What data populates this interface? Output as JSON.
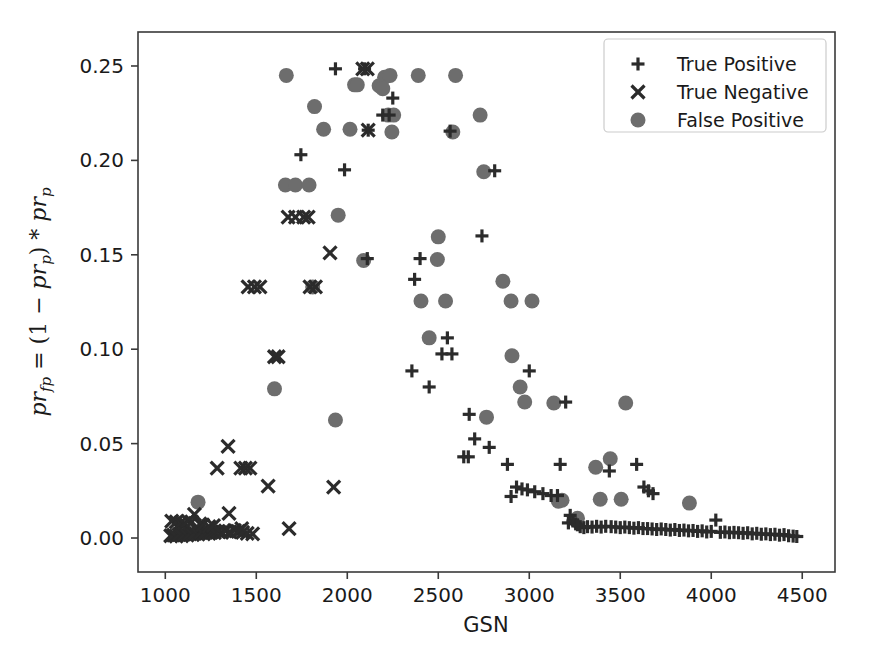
{
  "chart_data": {
    "type": "scatter",
    "title": "",
    "xlabel": "GSN",
    "ylabel": "pr_fp = (1 - pr_p) * pr_p",
    "ylabel_parts": {
      "sym1": "pr",
      "sub1": "fp",
      "eq": " = (1 ",
      "minus": "−",
      "sym2": " pr",
      "sub2": "p",
      "close": ") * ",
      "sym3": "pr",
      "sub3": "p"
    },
    "xlim": [
      850,
      4680
    ],
    "ylim": [
      -0.018,
      0.268
    ],
    "xticks": [
      1000,
      1500,
      2000,
      2500,
      3000,
      3500,
      4000,
      4500
    ],
    "xtick_labels": [
      "1000",
      "1500",
      "2000",
      "2500",
      "3000",
      "3500",
      "4000",
      "4500"
    ],
    "yticks": [
      0.0,
      0.05,
      0.1,
      0.15,
      0.2,
      0.25
    ],
    "ytick_labels": [
      "0.00",
      "0.05",
      "0.10",
      "0.15",
      "0.20",
      "0.25"
    ],
    "grid": false,
    "legend_position": "upper right",
    "colors": {
      "true_positive": "#2b2b2b",
      "true_negative": "#2b2b2b",
      "false_positive": "#6d6d6d",
      "axis": "#3a3a3a",
      "text": "#1a1a1a",
      "background": "#ffffff"
    },
    "series": [
      {
        "name": "True Positive",
        "marker": "plus",
        "color": "#2b2b2b",
        "points": [
          [
            1935,
            0.2485
          ],
          [
            2095,
            0.2485
          ],
          [
            2250,
            0.233
          ],
          [
            2195,
            0.224
          ],
          [
            2230,
            0.224
          ],
          [
            2565,
            0.2155
          ],
          [
            2115,
            0.216
          ],
          [
            2810,
            0.1945
          ],
          [
            1745,
            0.203
          ],
          [
            1985,
            0.195
          ],
          [
            2740,
            0.16
          ],
          [
            2110,
            0.148
          ],
          [
            2400,
            0.148
          ],
          [
            2370,
            0.137
          ],
          [
            2550,
            0.106
          ],
          [
            2520,
            0.0975
          ],
          [
            2575,
            0.0975
          ],
          [
            2355,
            0.0885
          ],
          [
            2450,
            0.08
          ],
          [
            3000,
            0.0885
          ],
          [
            2670,
            0.0655
          ],
          [
            2700,
            0.0525
          ],
          [
            2780,
            0.048
          ],
          [
            2640,
            0.043
          ],
          [
            2665,
            0.043
          ],
          [
            2880,
            0.039
          ],
          [
            3170,
            0.039
          ],
          [
            3440,
            0.0355
          ],
          [
            3590,
            0.039
          ],
          [
            2930,
            0.027
          ],
          [
            2960,
            0.026
          ],
          [
            2990,
            0.0255
          ],
          [
            3030,
            0.0245
          ],
          [
            3075,
            0.0235
          ],
          [
            3120,
            0.0225
          ],
          [
            3155,
            0.0225
          ],
          [
            2900,
            0.022
          ],
          [
            3200,
            0.072
          ],
          [
            3630,
            0.027
          ],
          [
            3655,
            0.025
          ],
          [
            3680,
            0.0235
          ],
          [
            3225,
            0.012
          ],
          [
            3255,
            0.0075
          ],
          [
            3280,
            0.006
          ],
          [
            3300,
            0.0055
          ],
          [
            3320,
            0.006
          ],
          [
            3345,
            0.0058
          ],
          [
            3370,
            0.0062
          ],
          [
            3395,
            0.0058
          ],
          [
            3420,
            0.0062
          ],
          [
            3450,
            0.006
          ],
          [
            3475,
            0.0058
          ],
          [
            3500,
            0.0055
          ],
          [
            3525,
            0.0058
          ],
          [
            3550,
            0.0055
          ],
          [
            3575,
            0.0052
          ],
          [
            3600,
            0.0055
          ],
          [
            3625,
            0.005
          ],
          [
            3650,
            0.005
          ],
          [
            3675,
            0.0048
          ],
          [
            3700,
            0.0045
          ],
          [
            3725,
            0.0048
          ],
          [
            3750,
            0.0045
          ],
          [
            3775,
            0.0042
          ],
          [
            3800,
            0.0045
          ],
          [
            3825,
            0.004
          ],
          [
            3850,
            0.0042
          ],
          [
            3875,
            0.0038
          ],
          [
            3900,
            0.004
          ],
          [
            3925,
            0.0035
          ],
          [
            3950,
            0.0038
          ],
          [
            3975,
            0.0032
          ],
          [
            4000,
            0.0035
          ],
          [
            4025,
            0.0095
          ],
          [
            4050,
            0.003
          ],
          [
            4075,
            0.0032
          ],
          [
            4100,
            0.0028
          ],
          [
            4125,
            0.003
          ],
          [
            4150,
            0.0028
          ],
          [
            4175,
            0.0025
          ],
          [
            4200,
            0.0028
          ],
          [
            4225,
            0.0022
          ],
          [
            4250,
            0.0025
          ],
          [
            4275,
            0.002
          ],
          [
            4300,
            0.0022
          ],
          [
            4325,
            0.0018
          ],
          [
            4350,
            0.002
          ],
          [
            4375,
            0.0015
          ],
          [
            4400,
            0.0018
          ],
          [
            4425,
            0.0012
          ],
          [
            4450,
            0.001
          ],
          [
            4470,
            0.0008
          ],
          [
            3215,
            0.008
          ],
          [
            3240,
            0.009
          ],
          [
            3265,
            0.007
          ]
        ]
      },
      {
        "name": "True Negative",
        "marker": "x",
        "color": "#2b2b2b",
        "points": [
          [
            2085,
            0.2485
          ],
          [
            2110,
            0.2485
          ],
          [
            2115,
            0.216
          ],
          [
            1675,
            0.17
          ],
          [
            1715,
            0.17
          ],
          [
            1760,
            0.17
          ],
          [
            1785,
            0.17
          ],
          [
            1905,
            0.151
          ],
          [
            1455,
            0.133
          ],
          [
            1490,
            0.133
          ],
          [
            1520,
            0.133
          ],
          [
            1795,
            0.133
          ],
          [
            1825,
            0.133
          ],
          [
            1600,
            0.096
          ],
          [
            1620,
            0.096
          ],
          [
            1345,
            0.0485
          ],
          [
            1285,
            0.037
          ],
          [
            1415,
            0.037
          ],
          [
            1440,
            0.037
          ],
          [
            1465,
            0.037
          ],
          [
            1565,
            0.0275
          ],
          [
            1925,
            0.027
          ],
          [
            1160,
            0.0125
          ],
          [
            1350,
            0.013
          ],
          [
            1035,
            0.009
          ],
          [
            1060,
            0.0085
          ],
          [
            1085,
            0.0082
          ],
          [
            1105,
            0.0078
          ],
          [
            1125,
            0.009
          ],
          [
            1145,
            0.0085
          ],
          [
            1190,
            0.0075
          ],
          [
            1420,
            0.005
          ],
          [
            1680,
            0.005
          ],
          [
            1030,
            0.0012
          ],
          [
            1045,
            0.0015
          ],
          [
            1060,
            0.001
          ],
          [
            1075,
            0.0018
          ],
          [
            1090,
            0.0012
          ],
          [
            1105,
            0.002
          ],
          [
            1120,
            0.0015
          ],
          [
            1135,
            0.0022
          ],
          [
            1150,
            0.0018
          ],
          [
            1165,
            0.0025
          ],
          [
            1180,
            0.002
          ],
          [
            1195,
            0.0028
          ],
          [
            1210,
            0.0022
          ],
          [
            1225,
            0.003
          ],
          [
            1240,
            0.0025
          ],
          [
            1255,
            0.0032
          ],
          [
            1270,
            0.0028
          ],
          [
            1290,
            0.0035
          ],
          [
            1310,
            0.003
          ],
          [
            1330,
            0.0038
          ],
          [
            1355,
            0.0032
          ],
          [
            1380,
            0.004
          ],
          [
            1400,
            0.0035
          ],
          [
            1425,
            0.003
          ],
          [
            1450,
            0.0025
          ],
          [
            1480,
            0.0022
          ],
          [
            1205,
            0.007
          ],
          [
            1240,
            0.006
          ],
          [
            1265,
            0.0065
          ]
        ]
      },
      {
        "name": "False Positive",
        "marker": "circle",
        "color": "#6d6d6d",
        "points": [
          [
            1665,
            0.245
          ],
          [
            2040,
            0.24
          ],
          [
            2055,
            0.24
          ],
          [
            2205,
            0.244
          ],
          [
            2235,
            0.245
          ],
          [
            2390,
            0.245
          ],
          [
            2595,
            0.245
          ],
          [
            2175,
            0.2395
          ],
          [
            2195,
            0.238
          ],
          [
            1820,
            0.2285
          ],
          [
            2730,
            0.224
          ],
          [
            2225,
            0.224
          ],
          [
            2255,
            0.224
          ],
          [
            1870,
            0.2165
          ],
          [
            2015,
            0.2165
          ],
          [
            2245,
            0.215
          ],
          [
            2580,
            0.215
          ],
          [
            1660,
            0.187
          ],
          [
            1715,
            0.187
          ],
          [
            1790,
            0.187
          ],
          [
            2750,
            0.194
          ],
          [
            1950,
            0.171
          ],
          [
            2500,
            0.1595
          ],
          [
            2495,
            0.1475
          ],
          [
            2090,
            0.147
          ],
          [
            1810,
            0.133
          ],
          [
            2855,
            0.136
          ],
          [
            2405,
            0.1255
          ],
          [
            2540,
            0.1255
          ],
          [
            2900,
            0.1255
          ],
          [
            3015,
            0.1255
          ],
          [
            2450,
            0.106
          ],
          [
            2905,
            0.0965
          ],
          [
            1600,
            0.079
          ],
          [
            2950,
            0.08
          ],
          [
            2975,
            0.072
          ],
          [
            3135,
            0.0715
          ],
          [
            2765,
            0.064
          ],
          [
            1935,
            0.0625
          ],
          [
            3530,
            0.0715
          ],
          [
            3445,
            0.042
          ],
          [
            3365,
            0.0375
          ],
          [
            3505,
            0.0205
          ],
          [
            3390,
            0.0205
          ],
          [
            3160,
            0.0195
          ],
          [
            3180,
            0.02
          ],
          [
            3880,
            0.0185
          ],
          [
            3265,
            0.0105
          ],
          [
            1180,
            0.019
          ]
        ]
      }
    ]
  },
  "legend": {
    "entries": [
      {
        "label": "True Positive",
        "marker": "plus"
      },
      {
        "label": "True Negative",
        "marker": "x"
      },
      {
        "label": "False Positive",
        "marker": "circle"
      }
    ]
  }
}
